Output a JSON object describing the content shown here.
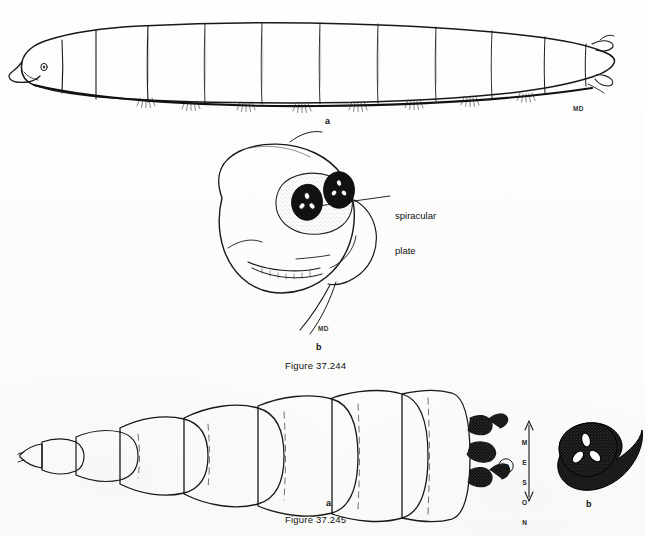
{
  "page": {
    "background_color": "#fdfdfc",
    "ink_color": "#1a1a1a"
  },
  "figures": [
    {
      "id": "figure-37-244",
      "caption": "Figure 37.244",
      "parts": [
        {
          "key": "a",
          "label": "a",
          "description": "lateral habitus of muscoid fly larva (maggot), head at left, segmented body with ventral creeping welts"
        },
        {
          "key": "b",
          "label": "b",
          "description": "posterior end of larva showing pair of spiracular plates"
        }
      ],
      "annotations": [
        {
          "key": "spiracular-plate",
          "text": "spiracular\nplate",
          "line1": "spiracular",
          "line2": "plate"
        }
      ],
      "artist_marks": [
        {
          "key": "md-top",
          "text": "MD"
        },
        {
          "key": "md-middle",
          "text": "MD"
        }
      ]
    },
    {
      "id": "figure-37-245",
      "caption": "Figure 37.245",
      "parts": [
        {
          "key": "a",
          "label": "a",
          "description": "dorsal or lateral view of segmented larva with tapered head and posterior spiracular processes"
        },
        {
          "key": "b",
          "label": "b",
          "description": "enlarged darkly sclerotized spiracular plate with three slits"
        }
      ],
      "annotations": [
        {
          "key": "meson-arrow",
          "text": "MESON",
          "letters": [
            "M",
            "E",
            "S",
            "O",
            "N"
          ],
          "arrow": "double-headed vertical arrow"
        }
      ],
      "artist_marks": [
        {
          "key": "circled-monogram",
          "text": "P"
        }
      ]
    }
  ]
}
